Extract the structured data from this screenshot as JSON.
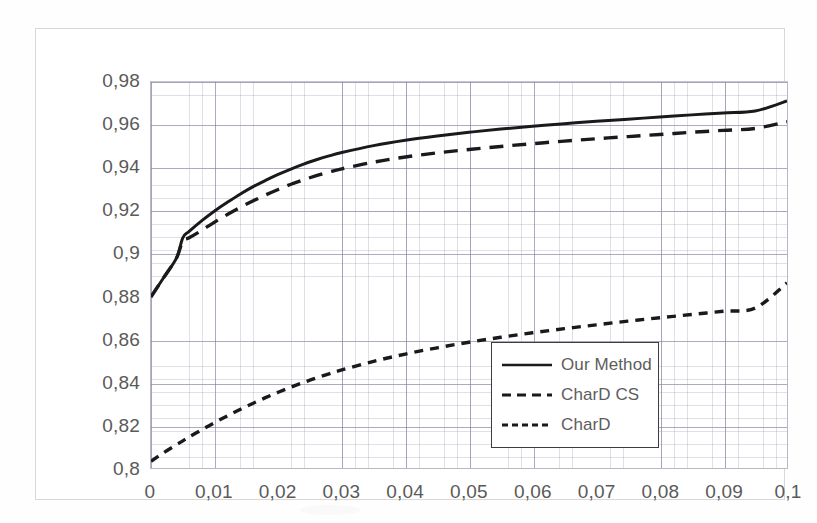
{
  "chart_data": {
    "type": "line",
    "title": "",
    "xlabel": "",
    "ylabel": "",
    "xlim": [
      0,
      0.1
    ],
    "ylim": [
      0.8,
      0.98
    ],
    "grid": true,
    "minor_grid": true,
    "decimal_separator": ",",
    "legend_position": "center-right-inside",
    "x_ticks": [
      "0",
      "0,01",
      "0,02",
      "0,03",
      "0,04",
      "0,05",
      "0,06",
      "0,07",
      "0,08",
      "0,09",
      "0,1"
    ],
    "x_tick_values": [
      0,
      0.01,
      0.02,
      0.03,
      0.04,
      0.05,
      0.06,
      0.07,
      0.08,
      0.09,
      0.1
    ],
    "y_ticks": [
      "0,98",
      "0,96",
      "0,94",
      "0,92",
      "0,9",
      "0,88",
      "0,86",
      "0,84",
      "0,82",
      "0,8"
    ],
    "y_tick_values": [
      0.98,
      0.96,
      0.94,
      0.92,
      0.9,
      0.88,
      0.86,
      0.84,
      0.82,
      0.8
    ],
    "x": [
      0,
      0.002,
      0.004,
      0.005,
      0.006,
      0.008,
      0.01,
      0.012,
      0.014,
      0.016,
      0.018,
      0.02,
      0.022,
      0.024,
      0.026,
      0.028,
      0.03,
      0.035,
      0.04,
      0.045,
      0.05,
      0.055,
      0.06,
      0.065,
      0.07,
      0.075,
      0.08,
      0.085,
      0.09,
      0.095,
      0.1
    ],
    "series": [
      {
        "name": "Our Method",
        "style": "solid",
        "color": "#1a1a1a",
        "values": [
          0.88,
          0.889,
          0.898,
          0.9075,
          0.9105,
          0.9155,
          0.92,
          0.924,
          0.9278,
          0.9312,
          0.9342,
          0.937,
          0.9395,
          0.9418,
          0.9438,
          0.9456,
          0.9472,
          0.9504,
          0.9529,
          0.9549,
          0.9566,
          0.9581,
          0.9594,
          0.9606,
          0.9617,
          0.9627,
          0.9637,
          0.9647,
          0.9656,
          0.9665,
          0.9712
        ]
      },
      {
        "name": "CharD CS",
        "style": "dashed-long",
        "color": "#1a1a1a",
        "values": [
          0.88,
          0.889,
          0.898,
          0.906,
          0.9075,
          0.911,
          0.9148,
          0.9183,
          0.9216,
          0.9246,
          0.9274,
          0.93,
          0.9324,
          0.9345,
          0.9364,
          0.9381,
          0.9396,
          0.9427,
          0.9451,
          0.947,
          0.9486,
          0.95,
          0.9513,
          0.9525,
          0.9536,
          0.9546,
          0.9556,
          0.9566,
          0.9575,
          0.9584,
          0.9615
        ]
      },
      {
        "name": "CharD",
        "style": "dashed-short",
        "color": "#1a1a1a",
        "values": [
          0.8035,
          0.8075,
          0.8112,
          0.813,
          0.8148,
          0.8182,
          0.8215,
          0.8246,
          0.8276,
          0.8304,
          0.8331,
          0.8356,
          0.838,
          0.8402,
          0.8423,
          0.8442,
          0.846,
          0.85,
          0.8534,
          0.8563,
          0.8589,
          0.8612,
          0.8633,
          0.8652,
          0.867,
          0.8687,
          0.8703,
          0.8718,
          0.8733,
          0.8748,
          0.8865
        ]
      }
    ]
  },
  "legend": {
    "items": [
      {
        "label": "Our Method",
        "style": "solid"
      },
      {
        "label": "CharD CS",
        "style": "dashed-long"
      },
      {
        "label": "CharD",
        "style": "dashed-short"
      }
    ]
  },
  "colors": {
    "series": "#1a1a1a",
    "tick_text": "#5a5a5a",
    "legend_text": "#5d5d5d",
    "grid_minor": "rgba(150,150,175,0.30)",
    "grid_major": "rgba(120,120,150,0.62)",
    "chart_border": "#d8d8d8",
    "plot_border": "#b9b9c4",
    "legend_border": "#3d3d3d",
    "background": "#ffffff"
  }
}
